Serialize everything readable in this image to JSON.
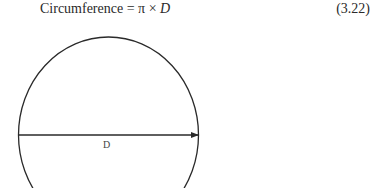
{
  "equation": {
    "lhs": "Circumference",
    "equals": "=",
    "pi": "π",
    "times": "×",
    "var": "D",
    "number": "(3.22)"
  },
  "figure": {
    "shape": "circle",
    "diameter_label": "D",
    "arrow_direction": "right",
    "stroke_color": "#2a2a2a"
  }
}
